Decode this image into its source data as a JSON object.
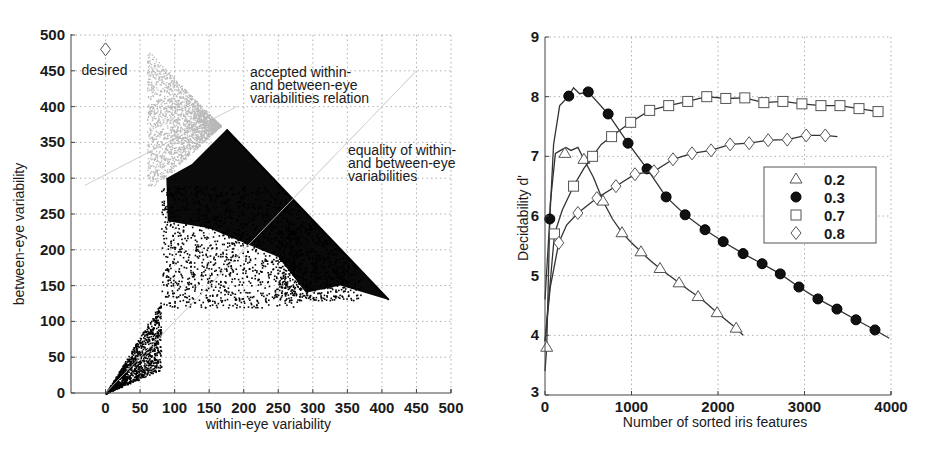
{
  "chart_data": [
    {
      "type": "scatter",
      "title": "",
      "xlabel": "within-eye variability",
      "ylabel": "between-eye variability",
      "xlim": [
        -50,
        500
      ],
      "ylim": [
        0,
        500
      ],
      "xticks": [
        0,
        50,
        100,
        150,
        200,
        250,
        300,
        350,
        400,
        450,
        500
      ],
      "yticks": [
        0,
        50,
        100,
        150,
        200,
        250,
        300,
        350,
        400,
        450,
        500
      ],
      "grid": true,
      "annotations": [
        {
          "text": "desired",
          "x": 0,
          "y": 480,
          "marker": "diamond"
        },
        {
          "text": "accepted within- and between-eye variabilities relation",
          "lines": [
            "accepted within-",
            "and between-eye",
            "variabilities relation"
          ]
        },
        {
          "text": "equality of within- and between-eye variabilities",
          "lines": [
            "equality of within-",
            "and between-eye",
            "variabilities"
          ]
        }
      ],
      "regions": [
        {
          "name": "accepted (light gray)",
          "color": "#bdbdbd",
          "polygon": [
            [
              60,
              470
            ],
            [
              175,
              368
            ],
            [
              125,
              320
            ],
            [
              90,
              300
            ],
            [
              75,
              350
            ],
            [
              70,
              420
            ]
          ]
        },
        {
          "name": "dense black band",
          "color": "#0a0a0a",
          "polygon": [
            [
              175,
              368
            ],
            [
              410,
              130
            ],
            [
              340,
              150
            ],
            [
              290,
              140
            ],
            [
              250,
              190
            ],
            [
              150,
              230
            ],
            [
              90,
              240
            ],
            [
              88,
              300
            ],
            [
              125,
              320
            ]
          ]
        }
      ],
      "reference_lines": [
        {
          "name": "equality line y=x",
          "from": [
            0,
            0
          ],
          "to": [
            450,
            450
          ],
          "color": "#cfcfcf"
        },
        {
          "name": "accepted relation line",
          "from": [
            -30,
            290
          ],
          "to": [
            190,
            400
          ],
          "color": "#cfcfcf"
        }
      ],
      "series": [
        {
          "name": "observations",
          "description": "dense point cloud from origin spreading to boundary x+y≈540",
          "color": "#000000"
        }
      ]
    },
    {
      "type": "line",
      "title": "",
      "xlabel": "Number of sorted iris features",
      "ylabel": "Decidability d'",
      "xlim": [
        0,
        4000
      ],
      "ylim": [
        3,
        9
      ],
      "xticks": [
        0,
        1000,
        2000,
        3000,
        4000
      ],
      "yticks": [
        3,
        4,
        5,
        6,
        7,
        8,
        9
      ],
      "grid": true,
      "legend": {
        "position": "inside right",
        "entries": [
          "0.2",
          "0.3",
          "0.7",
          "0.8"
        ]
      },
      "series": [
        {
          "name": "0.2",
          "marker": "triangle",
          "x": [
            20,
            230,
            450,
            670,
            890,
            1110,
            1330,
            1550,
            1770,
            1990,
            2210
          ],
          "y": [
            3.8,
            7.05,
            6.95,
            6.25,
            5.72,
            5.4,
            5.12,
            4.88,
            4.65,
            4.38,
            4.12
          ],
          "line_x": [
            0,
            20,
            60,
            120,
            180,
            240,
            300,
            380,
            450,
            560,
            670,
            780,
            890,
            1000,
            1110,
            1220,
            1330,
            1440,
            1550,
            1660,
            1770,
            1880,
            1990,
            2100,
            2210,
            2290
          ],
          "line_y": [
            3.4,
            3.8,
            6.2,
            7.05,
            7.1,
            7.15,
            7.1,
            7.15,
            6.95,
            6.65,
            6.25,
            5.95,
            5.72,
            5.55,
            5.4,
            5.25,
            5.12,
            5.0,
            4.88,
            4.76,
            4.65,
            4.52,
            4.38,
            4.25,
            4.12,
            4.0
          ]
        },
        {
          "name": "0.3",
          "marker": "filled-circle",
          "x": [
            55,
            275,
            500,
            730,
            960,
            1180,
            1400,
            1620,
            1850,
            2060,
            2290,
            2510,
            2720,
            2935,
            3155,
            3375,
            3595,
            3815
          ],
          "y": [
            5.95,
            8.01,
            8.08,
            7.71,
            7.22,
            6.79,
            6.32,
            6.02,
            5.77,
            5.57,
            5.37,
            5.2,
            5.03,
            4.81,
            4.61,
            4.44,
            4.26,
            4.09
          ],
          "line_x": [
            0,
            55,
            100,
            170,
            275,
            330,
            400,
            500,
            730,
            960,
            1180,
            1400,
            1620,
            1850,
            2060,
            2290,
            2510,
            2720,
            2935,
            3155,
            3375,
            3595,
            3815,
            3980
          ],
          "line_y": [
            4.6,
            5.95,
            7.2,
            7.85,
            8.01,
            8.15,
            8.05,
            8.08,
            7.71,
            7.22,
            6.79,
            6.32,
            6.02,
            5.77,
            5.57,
            5.37,
            5.2,
            5.03,
            4.81,
            4.61,
            4.44,
            4.26,
            4.09,
            3.95
          ]
        },
        {
          "name": "0.7",
          "marker": "square",
          "x": [
            110,
            330,
            550,
            770,
            990,
            1210,
            1430,
            1650,
            1870,
            2090,
            2310,
            2530,
            2750,
            2970,
            3190,
            3410,
            3630,
            3850
          ],
          "y": [
            5.7,
            6.5,
            7.0,
            7.33,
            7.57,
            7.77,
            7.85,
            7.92,
            8.0,
            7.97,
            7.98,
            7.9,
            7.92,
            7.88,
            7.85,
            7.85,
            7.8,
            7.75
          ],
          "line_x": [
            0,
            110,
            200,
            330,
            450,
            550,
            650,
            770,
            990,
            1210,
            1430,
            1650,
            1870,
            2090,
            2310,
            2530,
            2750,
            2970,
            3190,
            3410,
            3630,
            3850
          ],
          "line_y": [
            3.9,
            5.7,
            6.1,
            6.5,
            6.8,
            7.0,
            7.2,
            7.33,
            7.57,
            7.77,
            7.85,
            7.92,
            8.0,
            7.97,
            7.98,
            7.9,
            7.92,
            7.88,
            7.85,
            7.85,
            7.8,
            7.75
          ]
        },
        {
          "name": "0.8",
          "marker": "diamond",
          "x": [
            160,
            380,
            600,
            820,
            1040,
            1260,
            1480,
            1700,
            1920,
            2140,
            2360,
            2580,
            2800,
            3020,
            3240
          ],
          "y": [
            5.55,
            6.05,
            6.3,
            6.5,
            6.7,
            6.75,
            6.95,
            7.05,
            7.1,
            7.2,
            7.22,
            7.27,
            7.28,
            7.35,
            7.35
          ],
          "line_x": [
            0,
            60,
            160,
            250,
            380,
            600,
            820,
            1040,
            1260,
            1480,
            1700,
            1920,
            2140,
            2360,
            2580,
            2800,
            3020,
            3240,
            3380
          ],
          "line_y": [
            3.9,
            4.8,
            5.55,
            5.85,
            6.05,
            6.3,
            6.5,
            6.7,
            6.75,
            6.95,
            7.05,
            7.1,
            7.2,
            7.22,
            7.27,
            7.28,
            7.35,
            7.35,
            7.33
          ]
        }
      ]
    }
  ]
}
